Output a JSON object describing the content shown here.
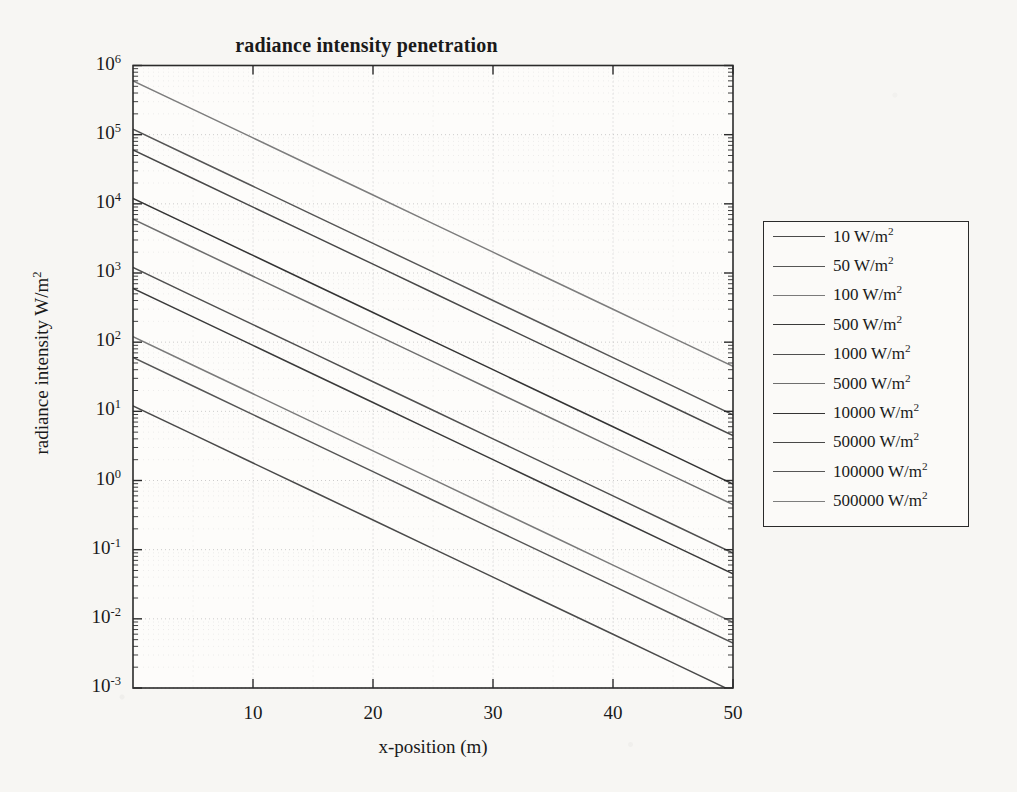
{
  "chart_data": {
    "type": "line",
    "title": "radiance intensity penetration",
    "xlabel": "x-position (m)",
    "ylabel": "radiance intensity W/m",
    "ylabel_exponent": "2",
    "xlim": [
      0,
      50
    ],
    "ylim": [
      0.001,
      1000000
    ],
    "yscale": "log",
    "xscale": "linear",
    "grid": true,
    "legend_position": "right-outside",
    "xticks": [
      10,
      20,
      30,
      40,
      50
    ],
    "xtick_labels": [
      "10",
      "20",
      "30",
      "40",
      "50"
    ],
    "yticks": [
      0.001,
      0.01,
      0.1,
      1,
      10,
      100,
      1000,
      10000,
      100000,
      1000000
    ],
    "ytick_labels": [
      "10-3",
      "10-2",
      "10-1",
      "100",
      "101",
      "102",
      "103",
      "104",
      "105",
      "106"
    ],
    "ytick_mantissa": "10",
    "ytick_exponents": [
      "-3",
      "-2",
      "-1",
      "0",
      "1",
      "2",
      "3",
      "4",
      "5",
      "6"
    ],
    "attenuation_coefficient_per_m": 0.19,
    "x": [
      0,
      5,
      10,
      15,
      20,
      25,
      30,
      35,
      40,
      45,
      50
    ],
    "series": [
      {
        "name": "10 W/m",
        "exponent": "2",
        "source_intensity": 10,
        "values": [
          12.0,
          4.64,
          1.79,
          0.693,
          0.268,
          0.1036,
          0.04,
          0.01548,
          0.00598,
          0.00231,
          0.00089
        ]
      },
      {
        "name": "50 W/m",
        "exponent": "2",
        "source_intensity": 50,
        "values": [
          60.0,
          23.2,
          8.97,
          3.47,
          1.341,
          0.518,
          0.2,
          0.0774,
          0.0299,
          0.01156,
          0.00447
        ]
      },
      {
        "name": "100 W/m",
        "exponent": "2",
        "source_intensity": 100,
        "values": [
          120.0,
          46.4,
          17.94,
          6.93,
          2.68,
          1.036,
          0.4,
          0.1548,
          0.0598,
          0.0231,
          0.0089
        ]
      },
      {
        "name": "500 W/m",
        "exponent": "2",
        "source_intensity": 500,
        "values": [
          600.0,
          232.0,
          89.7,
          34.7,
          13.41,
          5.18,
          2.0,
          0.774,
          0.299,
          0.1156,
          0.0447
        ]
      },
      {
        "name": "1000 W/m",
        "exponent": "2",
        "source_intensity": 1000,
        "values": [
          1200.0,
          464.0,
          179.4,
          69.3,
          26.8,
          10.36,
          4.0,
          1.548,
          0.598,
          0.231,
          0.089
        ]
      },
      {
        "name": "5000 W/m",
        "exponent": "2",
        "source_intensity": 5000,
        "values": [
          6000.0,
          2320.0,
          897.0,
          347.0,
          134.1,
          51.8,
          20.0,
          7.74,
          2.99,
          1.156,
          0.447
        ]
      },
      {
        "name": "10000 W/m",
        "exponent": "2",
        "source_intensity": 10000,
        "values": [
          12000.0,
          4640.0,
          1794.0,
          693.0,
          268.0,
          103.6,
          40.0,
          15.48,
          5.98,
          2.31,
          0.89
        ]
      },
      {
        "name": "50000 W/m",
        "exponent": "2",
        "source_intensity": 50000,
        "values": [
          60000.0,
          23200.0,
          8970.0,
          3470.0,
          1341.0,
          518.0,
          200.0,
          77.4,
          29.9,
          11.56,
          4.47
        ]
      },
      {
        "name": "100000 W/m",
        "exponent": "2",
        "source_intensity": 100000,
        "values": [
          120000.0,
          46400.0,
          17940.0,
          6930.0,
          2680.0,
          1036.0,
          400.0,
          154.8,
          59.8,
          23.1,
          8.9
        ]
      },
      {
        "name": "500000 W/m",
        "exponent": "2",
        "source_intensity": 500000,
        "values": [
          600000.0,
          232000.0,
          89700.0,
          34700.0,
          13410.0,
          5180.0,
          2000.0,
          774.0,
          299.0,
          115.6,
          44.7
        ]
      }
    ]
  },
  "legend": {
    "entries": [
      {
        "label": "10 W/m",
        "exp": "2"
      },
      {
        "label": "50 W/m",
        "exp": "2"
      },
      {
        "label": "100 W/m",
        "exp": "2"
      },
      {
        "label": "500 W/m",
        "exp": "2"
      },
      {
        "label": "1000 W/m",
        "exp": "2"
      },
      {
        "label": "5000 W/m",
        "exp": "2"
      },
      {
        "label": "10000 W/m",
        "exp": "2"
      },
      {
        "label": "50000 W/m",
        "exp": "2"
      },
      {
        "label": "100000 W/m",
        "exp": "2"
      },
      {
        "label": "500000 W/m",
        "exp": "2"
      }
    ]
  },
  "style": {
    "line_color": "#3a3a3a",
    "axis_color": "#2b2b2b",
    "grid_color": "#c9c9c9",
    "background": "#f7f6f3",
    "plot_background": "#fdfcfa"
  }
}
